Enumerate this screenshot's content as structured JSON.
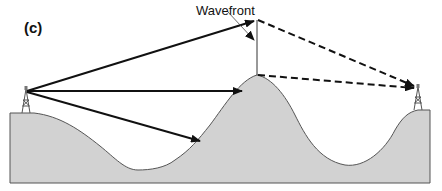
{
  "figure": {
    "panel_label": "(c)",
    "labels": {
      "wavefront": "Wavefront"
    },
    "elements": {
      "transmitter": "transmitter-tower-icon (left)",
      "receiver": "receiver-tower-icon (right)",
      "terrain": "hill / mountain obstruction between towers",
      "direct_rays": 3,
      "diffracted_rays": 2
    },
    "colors": {
      "ground_fill": "#d2d2d2",
      "ground_outline": "#555555",
      "ray": "#111111"
    }
  }
}
